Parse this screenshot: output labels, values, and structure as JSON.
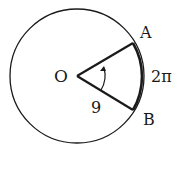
{
  "figure": {
    "center_label": "O",
    "point_a_label": "A",
    "point_b_label": "B",
    "radius_label": "9",
    "arc_length_label": "2π",
    "stroke_color": "#1a1a1a",
    "background_color": "#ffffff"
  }
}
